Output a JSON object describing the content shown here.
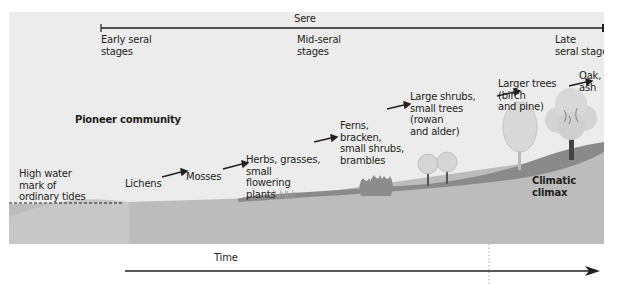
{
  "title": "Sere",
  "stage_labels": {
    "early": [
      "Early seral",
      "stages"
    ],
    "mid": [
      "Mid-seral",
      "stages"
    ],
    "late": [
      "Late",
      "seral stages"
    ]
  },
  "pioneer_label": "Pioneer community",
  "high_water": [
    "High water",
    "mark of",
    "ordinary tides"
  ],
  "succession": [
    {
      "name": "lichens",
      "lines": [
        "Lichens"
      ]
    },
    {
      "name": "mosses",
      "lines": [
        "Mosses"
      ]
    },
    {
      "name": "herbs",
      "lines": [
        "Herbs, grasses,",
        "small",
        "flowering",
        "plants"
      ]
    },
    {
      "name": "ferns",
      "lines": [
        "Ferns,",
        "bracken,",
        "small shrubs,",
        "brambles"
      ]
    },
    {
      "name": "shrubs",
      "lines": [
        "Large shrubs,",
        "small trees",
        "(rowan",
        "and alder)"
      ]
    },
    {
      "name": "larger-trees",
      "lines": [
        "Larger trees",
        "(birch",
        "and pine)"
      ]
    },
    {
      "name": "oak",
      "lines": [
        "Oak,",
        "ash"
      ]
    }
  ],
  "climax_label": [
    "Climatic",
    "climax"
  ],
  "time_label": "Time",
  "colors": {
    "panel": "#ececec",
    "ground_light": "#bdbdbd",
    "ground_dark": "#8a8a8a",
    "text": "#231f20",
    "arrow": "#231f20",
    "foliage": "#c8c8c8"
  }
}
